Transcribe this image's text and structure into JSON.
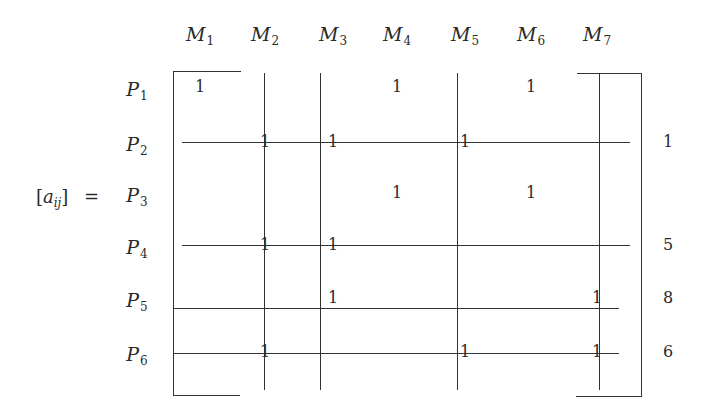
{
  "lhs": {
    "open": "[",
    "var": "a",
    "sub": "ij",
    "close": "]",
    "equals": "="
  },
  "columns": [
    {
      "letter": "M",
      "sub": "1",
      "x": 200
    },
    {
      "letter": "M",
      "sub": "2",
      "x": 265
    },
    {
      "letter": "M",
      "sub": "3",
      "x": 333
    },
    {
      "letter": "M",
      "sub": "4",
      "x": 397
    },
    {
      "letter": "M",
      "sub": "5",
      "x": 465
    },
    {
      "letter": "M",
      "sub": "6",
      "x": 531
    },
    {
      "letter": "M",
      "sub": "7",
      "x": 597
    }
  ],
  "rows": [
    {
      "letter": "P",
      "sub": "1",
      "y": 87
    },
    {
      "letter": "P",
      "sub": "2",
      "y": 142
    },
    {
      "letter": "P",
      "sub": "3",
      "y": 193
    },
    {
      "letter": "P",
      "sub": "4",
      "y": 245
    },
    {
      "letter": "P",
      "sub": "5",
      "y": 298
    },
    {
      "letter": "P",
      "sub": "6",
      "y": 352
    }
  ],
  "matrix": [
    [
      1,
      0,
      0,
      1,
      0,
      1,
      0
    ],
    [
      0,
      1,
      1,
      0,
      1,
      0,
      0
    ],
    [
      0,
      0,
      0,
      1,
      0,
      1,
      0
    ],
    [
      0,
      1,
      1,
      0,
      0,
      0,
      0
    ],
    [
      0,
      0,
      1,
      0,
      0,
      0,
      1
    ],
    [
      0,
      1,
      0,
      0,
      1,
      0,
      1
    ]
  ],
  "cell_label": "1",
  "row_order_labels": [
    {
      "row": 2,
      "label": "1"
    },
    {
      "row": 4,
      "label": "5"
    },
    {
      "row": 5,
      "label": "8"
    },
    {
      "row": 6,
      "label": "6"
    }
  ],
  "cover_lines": {
    "horizontal": [
      {
        "row": 2,
        "x1": 182,
        "x2": 630,
        "y": 142
      },
      {
        "row": 4,
        "x1": 182,
        "x2": 630,
        "y": 245
      },
      {
        "row": 5,
        "x1": 174,
        "x2": 619,
        "y": 308
      },
      {
        "row": 6,
        "x1": 174,
        "x2": 619,
        "y": 353
      }
    ],
    "vertical": [
      {
        "col": 2,
        "x": 264,
        "y1": 73,
        "y2": 390
      },
      {
        "col": 3,
        "x": 320,
        "y1": 73,
        "y2": 390
      },
      {
        "col": 5,
        "x": 457,
        "y1": 73,
        "y2": 390
      },
      {
        "col": 7,
        "x": 599,
        "y1": 73,
        "y2": 390
      }
    ]
  }
}
